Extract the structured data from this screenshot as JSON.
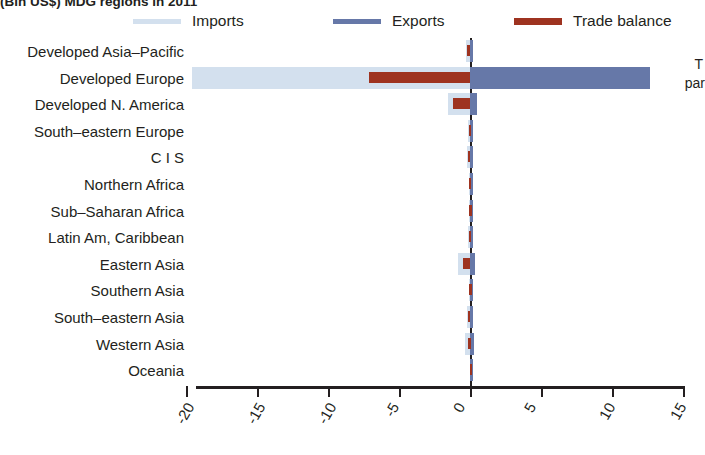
{
  "chart_data": {
    "type": "bar",
    "orientation": "horizontal",
    "title": "(Bln US$) MDG regions in 2011",
    "xlabel": "",
    "ylabel": "",
    "xlim": [
      -20,
      15
    ],
    "grid": false,
    "legend_position": "top",
    "xticks": [
      "-20",
      "-15",
      "-10",
      "-5",
      "0",
      "5",
      "10",
      "15"
    ],
    "xtick_values": [
      -20,
      -15,
      -10,
      -5,
      0,
      5,
      10,
      15
    ],
    "categories": [
      "Developed Asia–Pacific",
      "Developed Europe",
      "Developed N. America",
      "South–eastern Europe",
      "C I S",
      "Northern Africa",
      "Sub–Saharan Africa",
      "Latin Am, Caribbean",
      "Eastern Asia",
      "Southern Asia",
      "South–eastern Asia",
      "Western Asia",
      "Oceania"
    ],
    "series": [
      {
        "name": "Imports",
        "color": "#d3e0ee",
        "values": [
          -0.25,
          -19.6,
          -1.55,
          -0.12,
          -0.18,
          -0.1,
          -0.08,
          -0.12,
          -0.85,
          -0.06,
          -0.2,
          -0.35,
          -0.03
        ]
      },
      {
        "name": "Exports",
        "color": "#6678a8",
        "values": [
          0.08,
          12.7,
          0.5,
          0.05,
          0.1,
          0.04,
          0.03,
          0.06,
          0.35,
          0.03,
          0.07,
          0.3,
          0.02
        ]
      },
      {
        "name": "Trade balance",
        "color": "#9e3320",
        "values": [
          -0.2,
          -7.1,
          -1.2,
          -0.1,
          -0.15,
          -0.08,
          -0.06,
          -0.1,
          -0.5,
          -0.05,
          -0.17,
          -0.12,
          -0.02
        ]
      }
    ]
  },
  "legend": {
    "items": [
      {
        "label": "Imports",
        "color": "#d3e0ee"
      },
      {
        "label": "Exports",
        "color": "#6678a8"
      },
      {
        "label": "Trade balance",
        "color": "#9e3320"
      }
    ]
  },
  "right_note": {
    "line1": "T",
    "line2": "par"
  }
}
